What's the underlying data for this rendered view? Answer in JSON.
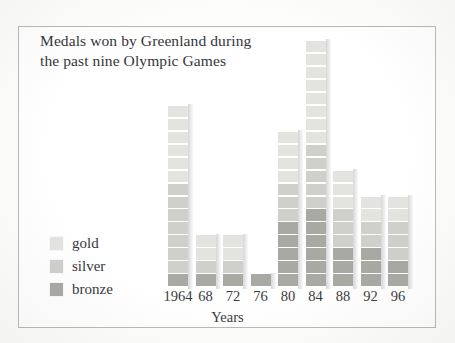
{
  "chart_data": {
    "type": "bar",
    "title": "Medals won by Greenland during\nthe past nine Olympic Games",
    "xlabel": "Years",
    "ylabel": "",
    "grid": false,
    "stacked": true,
    "unit_note": "each square represents one medal",
    "legend_position": "bottom-left",
    "categories": [
      "1964",
      "68",
      "72",
      "76",
      "80",
      "84",
      "88",
      "92",
      "96"
    ],
    "series": [
      {
        "name": "gold",
        "color": "#e3e3e0",
        "values": [
          6,
          2,
          2,
          0,
          4,
          8,
          3,
          2,
          2
        ]
      },
      {
        "name": "silver",
        "color": "#cfcfcb",
        "values": [
          7,
          1,
          1,
          0,
          3,
          5,
          3,
          2,
          3
        ]
      },
      {
        "name": "bronze",
        "color": "#a9a9a4",
        "values": [
          1,
          1,
          1,
          1,
          5,
          6,
          3,
          3,
          2
        ]
      }
    ],
    "totals": [
      14,
      4,
      4,
      1,
      12,
      19,
      9,
      7,
      7
    ],
    "ylim": [
      0,
      20
    ]
  },
  "legend": {
    "items": [
      {
        "label": "gold",
        "color": "#e3e3e0"
      },
      {
        "label": "silver",
        "color": "#cfcfcb"
      },
      {
        "label": "bronze",
        "color": "#a9a9a4"
      }
    ]
  }
}
